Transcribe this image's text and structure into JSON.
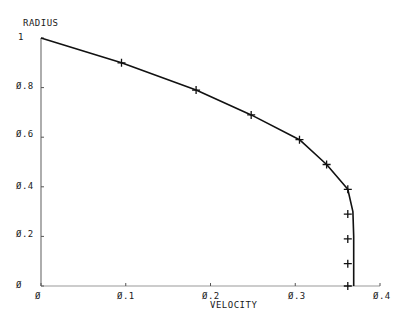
{
  "chart_data": {
    "type": "line",
    "title": "",
    "xlabel": "VELOCITY",
    "ylabel": "RADIUS",
    "xlim": [
      0,
      0.4
    ],
    "ylim": [
      0,
      1
    ],
    "grid": false,
    "x_ticks": [
      "Ø",
      "Ø.1",
      "Ø.2",
      "Ø.3",
      "Ø.4"
    ],
    "y_ticks": [
      "Ø",
      "Ø.2",
      "Ø.4",
      "Ø.6",
      "Ø.8",
      "1"
    ],
    "series": [
      {
        "name": "curve",
        "style": "solid line",
        "x": [
          0.0,
          0.095,
          0.183,
          0.248,
          0.305,
          0.337,
          0.362,
          0.368,
          0.369,
          0.369,
          0.369
        ],
        "y": [
          1.0,
          0.9,
          0.79,
          0.69,
          0.59,
          0.49,
          0.39,
          0.3,
          0.2,
          0.1,
          0.0
        ]
      },
      {
        "name": "markers",
        "style": "plus markers",
        "x": [
          0.095,
          0.183,
          0.248,
          0.305,
          0.337,
          0.362,
          0.362,
          0.362,
          0.362,
          0.362
        ],
        "y": [
          0.9,
          0.79,
          0.69,
          0.59,
          0.49,
          0.39,
          0.29,
          0.19,
          0.09,
          0.0
        ]
      }
    ]
  }
}
